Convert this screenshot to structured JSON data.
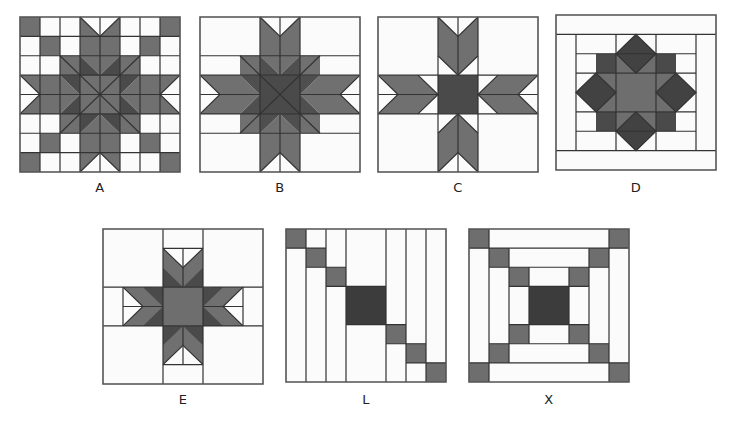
{
  "colors": {
    "background": "#fbfbfb",
    "medium": "#6e6e6e",
    "dark": "#4a4a4a",
    "darkest": "#3a3a3a",
    "line": "#333333"
  },
  "blocks": [
    {
      "id": "A",
      "label": "A",
      "x": 20,
      "y": 17,
      "size": 160,
      "label_y": 180
    },
    {
      "id": "B",
      "label": "B",
      "x": 200,
      "y": 17,
      "size": 160,
      "label_y": 180
    },
    {
      "id": "C",
      "label": "C",
      "x": 378,
      "y": 17,
      "size": 160,
      "label_y": 180
    },
    {
      "id": "D",
      "label": "D",
      "x": 556,
      "y": 15,
      "size": 160,
      "label_y": 180
    },
    {
      "id": "E",
      "label": "E",
      "x": 103,
      "y": 229,
      "size": 160,
      "label_y": 392
    },
    {
      "id": "L",
      "label": "L",
      "x": 286,
      "y": 229,
      "size": 160,
      "label_y": 392
    },
    {
      "id": "X",
      "label": "X",
      "x": 469,
      "y": 229,
      "size": 160,
      "label_y": 392
    }
  ]
}
